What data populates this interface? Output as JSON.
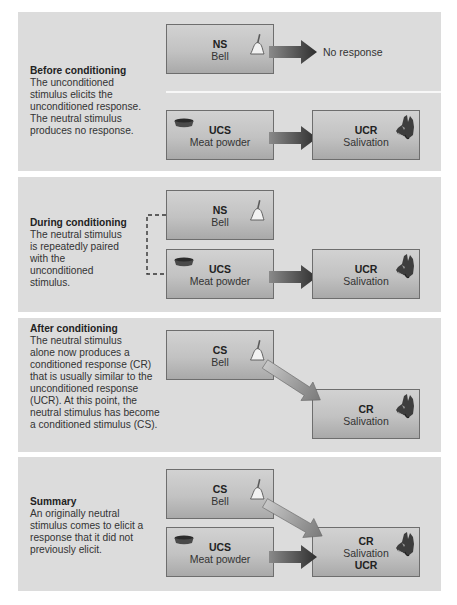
{
  "panels": [
    {
      "title": "Before conditioning",
      "lines": [
        "The unconditioned",
        "stimulus elicits the",
        "unconditioned response.",
        "The neutral stimulus",
        "produces no response."
      ],
      "boxes": {
        "ns": {
          "code": "NS",
          "name": "Bell",
          "icon": "bell-icon"
        },
        "ucs": {
          "code": "UCS",
          "name": "Meat powder",
          "icon": "food-bowl-icon"
        },
        "ucr": {
          "code": "UCR",
          "name": "Salivation",
          "icon": "dog-head-icon"
        }
      },
      "no_response": "No response"
    },
    {
      "title": "During conditioning",
      "lines": [
        "The neutral stimulus",
        "is repeatedly paired",
        "with the",
        "unconditioned",
        "stimulus."
      ],
      "boxes": {
        "ns": {
          "code": "NS",
          "name": "Bell",
          "icon": "bell-icon"
        },
        "ucs": {
          "code": "UCS",
          "name": "Meat powder",
          "icon": "food-bowl-icon"
        },
        "ucr": {
          "code": "UCR",
          "name": "Salivation",
          "icon": "dog-head-icon"
        }
      }
    },
    {
      "title": "After conditioning",
      "lines": [
        "The neutral stimulus",
        "alone now produces a",
        "conditioned response (CR)",
        "that is usually similar to the",
        "unconditioned response",
        "(UCR). At this point, the",
        "neutral stimulus has become",
        "a conditioned stimulus (CS)."
      ],
      "boxes": {
        "cs": {
          "code": "CS",
          "name": "Bell",
          "icon": "bell-icon"
        },
        "cr": {
          "code": "CR",
          "name": "Salivation",
          "icon": "dog-head-icon"
        }
      }
    },
    {
      "title": "Summary",
      "lines": [
        "An originally neutral",
        "stimulus comes to elicit a",
        "response that it did not",
        "previously elicit."
      ],
      "boxes": {
        "cs": {
          "code": "CS",
          "name": "Bell",
          "icon": "bell-icon"
        },
        "ucs": {
          "code": "UCS",
          "name": "Meat powder",
          "icon": "food-bowl-icon"
        },
        "cr": {
          "code": "CR",
          "name": "Salivation",
          "code2": "UCR",
          "icon": "dog-head-icon"
        }
      }
    }
  ],
  "colors": {
    "panel_bg": "#dcdcdc",
    "box_top": "#d2d2d2",
    "box_bottom": "#a9a9a9",
    "arrow_dark": "#3a3a3a",
    "arrow_light": "#9a9a9a"
  }
}
